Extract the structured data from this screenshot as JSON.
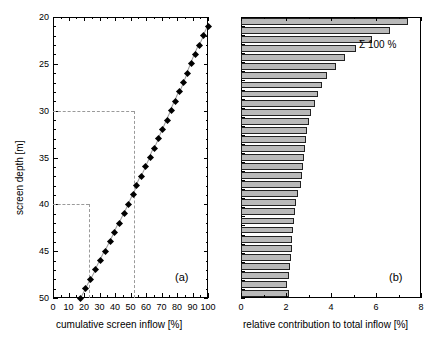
{
  "figure": {
    "panel_a_label": "(a)",
    "panel_b_label": "(b)",
    "annotation_sum": "Σ 100 %"
  },
  "chart_data": [
    {
      "type": "scatter",
      "panel": "(a)",
      "title": "",
      "xlabel": "cumulative screen inflow [%]",
      "ylabel": "screen depth [m]",
      "xlim": [
        0,
        100
      ],
      "ylim": [
        50,
        20
      ],
      "y_inverted": true,
      "grid": false,
      "legend": "none",
      "xticks": [
        0,
        10,
        20,
        30,
        40,
        50,
        60,
        70,
        80,
        90,
        100
      ],
      "xticklabels": [
        "0",
        "10",
        "20",
        "30",
        "40",
        "50",
        "60",
        "70",
        "80",
        "90",
        "100"
      ],
      "yticks": [
        20,
        25,
        30,
        35,
        40,
        45,
        50
      ],
      "yticklabels": [
        "20",
        "25",
        "30",
        "35",
        "40",
        "45",
        "50"
      ],
      "x_minor_interval": 5,
      "y_minor_interval": 1,
      "marker": "filled-diamond",
      "series": [
        {
          "name": "cumulative screen inflow",
          "x": [
            100.0,
            97.3,
            94.5,
            91.8,
            89.3,
            86.8,
            84.2,
            81.6,
            79.0,
            76.3,
            73.6,
            70.9,
            68.2,
            65.4,
            62.6,
            59.8,
            57.0,
            54.1,
            51.8,
            48.9,
            45.9,
            42.9,
            39.9,
            36.8,
            33.7,
            30.6,
            27.5,
            24.3,
            21.1,
            17.8,
            14.5,
            11.2,
            8.0,
            5.0,
            2.1
          ],
          "y": [
            21.0,
            22.0,
            23.0,
            24.0,
            25.0,
            26.0,
            27.0,
            28.0,
            29.0,
            30.0,
            31.0,
            32.0,
            33.0,
            34.0,
            35.0,
            36.0,
            37.0,
            38.0,
            39.0,
            40.0,
            41.0,
            42.0,
            43.0,
            44.0,
            45.0,
            46.0,
            47.0,
            48.0,
            49.0,
            50.0,
            51.0,
            52.0,
            53.0,
            54.0,
            55.0
          ]
        }
      ],
      "guide_lines": [
        {
          "type": "horizontal",
          "y": 30,
          "from_x": 0,
          "to_x": 52
        },
        {
          "type": "vertical",
          "x": 52,
          "from_y": 30,
          "to_y": 50
        },
        {
          "type": "horizontal",
          "y": 40,
          "from_x": 0,
          "to_x": 23
        },
        {
          "type": "vertical",
          "x": 23,
          "from_y": 40,
          "to_y": 50
        }
      ]
    },
    {
      "type": "bar",
      "orientation": "horizontal",
      "panel": "(b)",
      "title": "",
      "xlabel": "relative contribution to total inflow [%]",
      "ylabel": "",
      "xlim": [
        0,
        8
      ],
      "grid": false,
      "legend": "none",
      "xticks": [
        0,
        2,
        4,
        6,
        8
      ],
      "xticklabels": [
        "0",
        "2",
        "4",
        "6",
        "8"
      ],
      "x_minor_interval": 1,
      "annotation": "Σ 100 %",
      "categories": [
        "1",
        "2",
        "3",
        "4",
        "5",
        "6",
        "7",
        "8",
        "9",
        "10",
        "11",
        "12",
        "13",
        "14",
        "15",
        "16",
        "17",
        "18",
        "19",
        "20",
        "21",
        "22",
        "23",
        "24",
        "25",
        "26",
        "27",
        "28",
        "29",
        "30",
        "31"
      ],
      "values": [
        7.4,
        6.6,
        5.8,
        5.1,
        4.6,
        4.2,
        3.8,
        3.6,
        3.4,
        3.3,
        3.1,
        3.0,
        2.95,
        2.9,
        2.85,
        2.8,
        2.75,
        2.7,
        2.65,
        2.55,
        2.45,
        2.4,
        2.35,
        2.3,
        2.28,
        2.25,
        2.2,
        2.18,
        2.12,
        2.05,
        2.15
      ]
    }
  ]
}
